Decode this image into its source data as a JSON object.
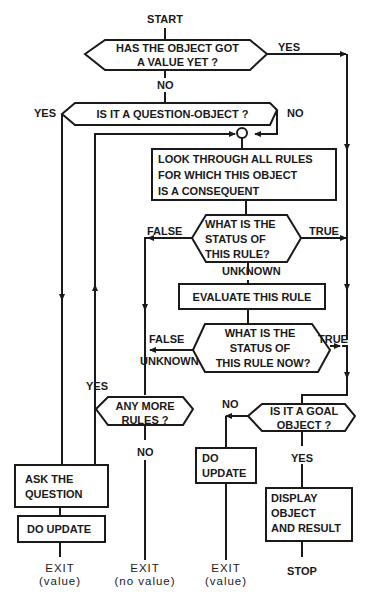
{
  "flowchart": {
    "start": "START",
    "decision_has_value": {
      "line1": "HAS THE OBJECT GOT",
      "line2": "A VALUE YET ?",
      "yes": "YES",
      "no": "NO"
    },
    "decision_question_object": {
      "text": "IS IT A QUESTION-OBJECT ?",
      "yes": "YES",
      "no": "NO"
    },
    "process_look_through": {
      "line1": "LOOK THROUGH ALL RULES",
      "line2": "FOR WHICH THIS OBJECT",
      "line3": "IS A CONSEQUENT"
    },
    "decision_rule_status": {
      "line1": "WHAT IS THE",
      "line2": "STATUS OF",
      "line3": "THIS RULE?",
      "false": "FALSE",
      "true": "TRUE",
      "unknown": "UNKNOWN"
    },
    "process_evaluate": {
      "text": "EVALUATE THIS RULE"
    },
    "decision_rule_status_now": {
      "line1": "WHAT IS THE",
      "line2": "STATUS OF",
      "line3": "THIS RULE NOW?",
      "false": "FALSE",
      "unknown": "UNKNOWN",
      "true": "TRUE"
    },
    "decision_more_rules": {
      "line1": "ANY MORE",
      "line2": "RULES ?",
      "yes": "YES",
      "no": "NO"
    },
    "decision_goal_object": {
      "line1": "IS IT A GOAL",
      "line2": "OBJECT ?",
      "no": "NO",
      "yes": "YES"
    },
    "process_ask_question": {
      "line1": "ASK THE",
      "line2": "QUESTION"
    },
    "process_do_update_left": {
      "text": "DO UPDATE"
    },
    "process_do_update_mid": {
      "line1": "DO",
      "line2": "UPDATE"
    },
    "process_display": {
      "line1": "DISPLAY",
      "line2": "OBJECT",
      "line3": "AND RESULT"
    },
    "terminals": {
      "exit_value_left": {
        "line1": "EXIT",
        "line2": "(value)"
      },
      "exit_no_value": {
        "line1": "EXIT",
        "line2": "(no value)"
      },
      "exit_value_mid": {
        "line1": "EXIT",
        "line2": "(value)"
      },
      "stop": "STOP"
    }
  }
}
